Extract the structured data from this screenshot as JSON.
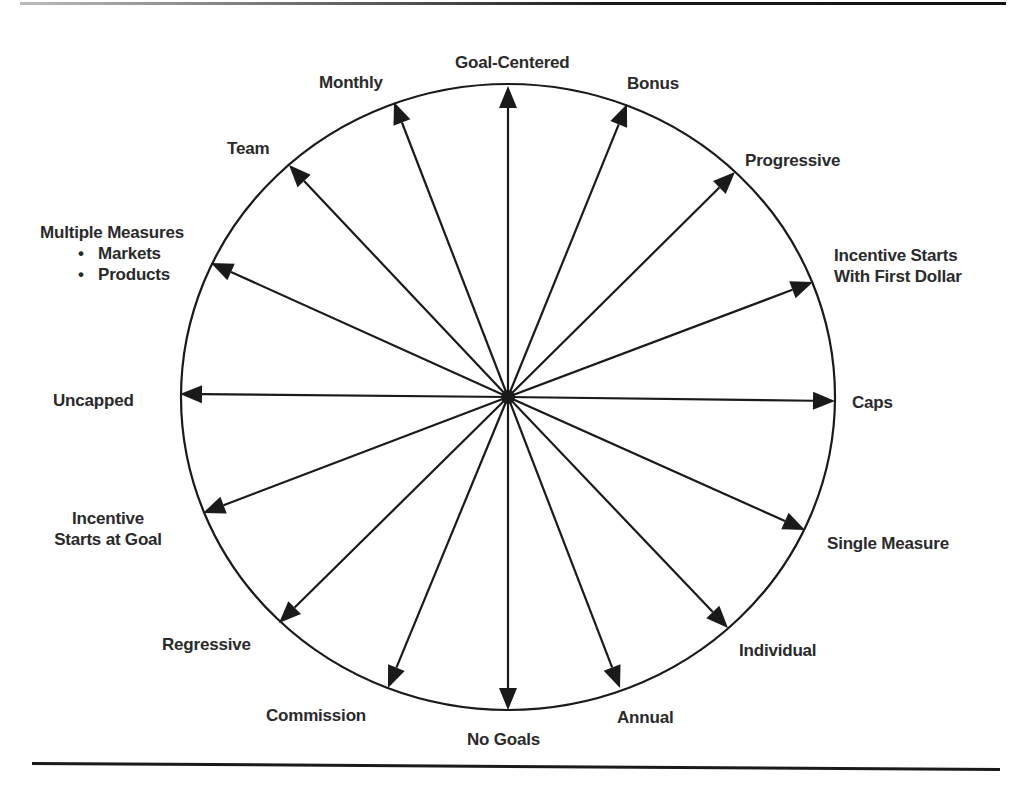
{
  "diagram": {
    "type": "radial-arrow-wheel",
    "center": {
      "x": 508,
      "y": 397
    },
    "rx": 327,
    "ry": 313,
    "stroke_color": "#1a1a1a",
    "label_color": "#2a2a2a",
    "spokes": [
      {
        "id": "goal-centered",
        "label": "Goal-Centered",
        "tip": [
          508,
          86
        ]
      },
      {
        "id": "bonus",
        "label": "Bonus",
        "tip": [
          627,
          104
        ]
      },
      {
        "id": "progressive",
        "label": "Progressive",
        "tip": [
          735,
          172
        ]
      },
      {
        "id": "incentive-starts-first-dollar",
        "label": "Incentive Starts With First Dollar",
        "tip": [
          813,
          282
        ]
      },
      {
        "id": "caps",
        "label": "Caps",
        "tip": [
          835,
          401
        ]
      },
      {
        "id": "single-measure",
        "label": "Single Measure",
        "tip": [
          805,
          530
        ]
      },
      {
        "id": "individual",
        "label": "Individual",
        "tip": [
          728,
          628
        ]
      },
      {
        "id": "annual",
        "label": "Annual",
        "tip": [
          620,
          688
        ]
      },
      {
        "id": "no-goals",
        "label": "No Goals",
        "tip": [
          508,
          710
        ]
      },
      {
        "id": "commission",
        "label": "Commission",
        "tip": [
          388,
          688
        ]
      },
      {
        "id": "regressive",
        "label": "Regressive",
        "tip": [
          279,
          623
        ]
      },
      {
        "id": "incentive-starts-at-goal",
        "label": "Incentive Starts at Goal",
        "tip": [
          203,
          513
        ]
      },
      {
        "id": "uncapped",
        "label": "Uncapped",
        "tip": [
          180,
          394
        ]
      },
      {
        "id": "multiple-measures",
        "label": "Multiple Measures",
        "tip": [
          211,
          263
        ]
      },
      {
        "id": "team",
        "label": "Team",
        "tip": [
          289,
          165
        ]
      },
      {
        "id": "monthly",
        "label": "Monthly",
        "tip": [
          394,
          102
        ]
      }
    ]
  },
  "labels": {
    "goal_centered": "Goal-Centered",
    "bonus": "Bonus",
    "progressive": "Progressive",
    "first_dollar_line1": "Incentive Starts",
    "first_dollar_line2": "With First Dollar",
    "caps": "Caps",
    "single_measure": "Single Measure",
    "individual": "Individual",
    "annual": "Annual",
    "no_goals": "No Goals",
    "commission": "Commission",
    "regressive": "Regressive",
    "at_goal_line1": "Incentive",
    "at_goal_line2": "Starts at Goal",
    "uncapped": "Uncapped",
    "multiple_measures": "Multiple Measures",
    "multiple_measures_items": [
      "Markets",
      "Products"
    ],
    "team": "Team",
    "monthly": "Monthly"
  }
}
